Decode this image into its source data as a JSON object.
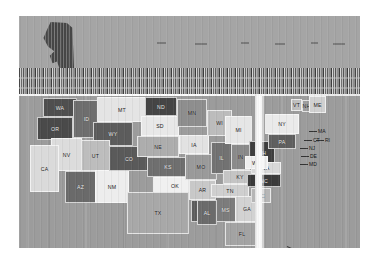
{
  "figure": {
    "kind": "choropleth-map",
    "region": "United States",
    "render_state": "corrupted",
    "background_color": "#9e9e9e",
    "frame_color": "#ffffff"
  },
  "artifacts": {
    "upper_plate_label": "corrupted-upper-plate",
    "glitch_band_label": "vertical-streak-glitch-band",
    "scanline_label": "bright-scanline",
    "white_column_label": "white-column-artifact",
    "alaska_blob_label": "alaska-dark-blob"
  },
  "markers": {
    "dc": {
      "label": "DC",
      "color": "#2f2f2f"
    },
    "hi": {
      "label": "HI"
    }
  },
  "chart_data": {
    "type": "heatmap",
    "title": "",
    "xlabel": "",
    "ylabel": "",
    "legend_position": "none",
    "grid": false,
    "categories": [
      "WA",
      "OR",
      "ID",
      "MT",
      "WY",
      "NV",
      "UT",
      "CA",
      "AZ",
      "NM",
      "CO",
      "ND",
      "SD",
      "NE",
      "KS",
      "OK",
      "TX",
      "MN",
      "IA",
      "MO",
      "AR",
      "LA",
      "WI",
      "IL",
      "MI",
      "IN",
      "OH",
      "KY",
      "TN",
      "MS",
      "AL",
      "GA",
      "FL",
      "SC",
      "NC",
      "VA",
      "WV",
      "PA",
      "NY",
      "VT",
      "NH",
      "ME",
      "MA",
      "CT",
      "RI",
      "NJ",
      "DE",
      "MD",
      "AK",
      "HI",
      "DC"
    ],
    "values": [
      0.78,
      0.8,
      0.62,
      0.18,
      0.66,
      0.22,
      0.3,
      0.2,
      0.64,
      0.24,
      0.7,
      0.82,
      0.16,
      0.44,
      0.72,
      0.14,
      0.34,
      0.36,
      0.4,
      0.46,
      0.3,
      0.74,
      0.32,
      0.68,
      0.26,
      0.6,
      0.86,
      0.28,
      0.38,
      0.76,
      0.84,
      0.42,
      0.34,
      0.3,
      0.88,
      0.36,
      0.58,
      0.72,
      0.24,
      0.4,
      0.5,
      0.26,
      0.62,
      0.54,
      0.48,
      0.66,
      0.44,
      0.52,
      0.9,
      0.3,
      0.95
    ],
    "value_range": [
      0,
      1
    ],
    "colorscale": "grayscale"
  },
  "states": [
    {
      "abbr": "WA",
      "x": 24,
      "y": 2,
      "w": 34,
      "h": 19,
      "tone": "#4f4f4f",
      "lbl": "dark"
    },
    {
      "abbr": "OR",
      "x": 18,
      "y": 21,
      "w": 36,
      "h": 23,
      "tone": "#4a4a4a",
      "lbl": "dark"
    },
    {
      "abbr": "ID",
      "x": 54,
      "y": 4,
      "w": 27,
      "h": 38,
      "tone": "#6e6e6e",
      "lbl": "dark"
    },
    {
      "abbr": "MT",
      "x": 78,
      "y": 1,
      "w": 50,
      "h": 25,
      "tone": "#e4e4e4",
      "lbl": "light"
    },
    {
      "abbr": "WY",
      "x": 74,
      "y": 26,
      "w": 40,
      "h": 24,
      "tone": "#5c5c5c",
      "lbl": "dark"
    },
    {
      "abbr": "NV",
      "x": 32,
      "y": 42,
      "w": 31,
      "h": 33,
      "tone": "#dcdcdc",
      "lbl": "light"
    },
    {
      "abbr": "UT",
      "x": 62,
      "y": 44,
      "w": 29,
      "h": 31,
      "tone": "#bdbdbd",
      "lbl": "light"
    },
    {
      "abbr": "CA",
      "x": 11,
      "y": 49,
      "w": 29,
      "h": 47,
      "tone": "#dadada",
      "lbl": "light"
    },
    {
      "abbr": "AZ",
      "x": 46,
      "y": 75,
      "w": 31,
      "h": 32,
      "tone": "#6a6a6a",
      "lbl": "dark"
    },
    {
      "abbr": "NM",
      "x": 76,
      "y": 74,
      "w": 34,
      "h": 33,
      "tone": "#ededed",
      "lbl": "light"
    },
    {
      "abbr": "CO",
      "x": 90,
      "y": 50,
      "w": 40,
      "h": 25,
      "tone": "#5a5a5a",
      "lbl": "dark"
    },
    {
      "abbr": "ND",
      "x": 126,
      "y": 1,
      "w": 32,
      "h": 19,
      "tone": "#454545",
      "lbl": "dark"
    },
    {
      "abbr": "SD",
      "x": 122,
      "y": 20,
      "w": 38,
      "h": 20,
      "tone": "#e8e8e8",
      "lbl": "light"
    },
    {
      "abbr": "NE",
      "x": 118,
      "y": 40,
      "w": 42,
      "h": 21,
      "tone": "#adadad",
      "lbl": "light"
    },
    {
      "abbr": "KS",
      "x": 128,
      "y": 61,
      "w": 42,
      "h": 20,
      "tone": "#6f6f6f",
      "lbl": "dark"
    },
    {
      "abbr": "OK",
      "x": 134,
      "y": 81,
      "w": 44,
      "h": 17,
      "tone": "#f0f0f0",
      "lbl": "light"
    },
    {
      "abbr": "TX",
      "x": 108,
      "y": 96,
      "w": 62,
      "h": 42,
      "tone": "#a8a8a8",
      "lbl": "light"
    },
    {
      "abbr": "MN",
      "x": 158,
      "y": 3,
      "w": 30,
      "h": 28,
      "tone": "#8e8e8e",
      "lbl": "light"
    },
    {
      "abbr": "IA",
      "x": 160,
      "y": 39,
      "w": 30,
      "h": 19,
      "tone": "#e2e2e2",
      "lbl": "light"
    },
    {
      "abbr": "MO",
      "x": 166,
      "y": 58,
      "w": 32,
      "h": 26,
      "tone": "#9a9a9a",
      "lbl": "light"
    },
    {
      "abbr": "AR",
      "x": 170,
      "y": 84,
      "w": 27,
      "h": 20,
      "tone": "#c8c8c8",
      "lbl": "light"
    },
    {
      "abbr": "LA",
      "x": 172,
      "y": 104,
      "w": 27,
      "h": 22,
      "tone": "#5d5d5d",
      "lbl": "dark"
    },
    {
      "abbr": "WI",
      "x": 188,
      "y": 14,
      "w": 25,
      "h": 26,
      "tone": "#bcbcbc",
      "lbl": "light"
    },
    {
      "abbr": "IL",
      "x": 192,
      "y": 46,
      "w": 21,
      "h": 32,
      "tone": "#727272",
      "lbl": "dark"
    },
    {
      "abbr": "MI",
      "x": 206,
      "y": 20,
      "w": 27,
      "h": 28,
      "tone": "#e6e6e6",
      "lbl": "light"
    },
    {
      "abbr": "IN",
      "x": 212,
      "y": 48,
      "w": 19,
      "h": 26,
      "tone": "#8a8a8a",
      "lbl": "light"
    },
    {
      "abbr": "OH",
      "x": 230,
      "y": 45,
      "w": 26,
      "h": 24,
      "tone": "#3f3f3f",
      "lbl": "dark"
    },
    {
      "abbr": "KY",
      "x": 204,
      "y": 74,
      "w": 34,
      "h": 14,
      "tone": "#c4c4c4",
      "lbl": "light"
    },
    {
      "abbr": "TN",
      "x": 192,
      "y": 88,
      "w": 38,
      "h": 13,
      "tone": "#cfcfcf",
      "lbl": "light"
    },
    {
      "abbr": "MS",
      "x": 196,
      "y": 101,
      "w": 21,
      "h": 25,
      "tone": "#7c7c7c",
      "lbl": "dark"
    },
    {
      "abbr": "AL",
      "x": 178,
      "y": 104,
      "w": 20,
      "h": 25,
      "tone": "#6b6b6b",
      "lbl": "dark"
    },
    {
      "abbr": "GA",
      "x": 216,
      "y": 100,
      "w": 24,
      "h": 26,
      "tone": "#d2d2d2",
      "lbl": "light"
    },
    {
      "abbr": "FL",
      "x": 206,
      "y": 126,
      "w": 34,
      "h": 24,
      "tone": "#a3a3a3",
      "lbl": "light"
    },
    {
      "abbr": "SC",
      "x": 232,
      "y": 92,
      "w": 20,
      "h": 15,
      "tone": "#b6b6b6",
      "lbl": "light"
    },
    {
      "abbr": "NC",
      "x": 228,
      "y": 78,
      "w": 34,
      "h": 13,
      "tone": "#3b3b3b",
      "lbl": "dark"
    },
    {
      "abbr": "VA",
      "x": 232,
      "y": 66,
      "w": 30,
      "h": 12,
      "tone": "#d8d8d8",
      "lbl": "light"
    },
    {
      "abbr": "WV",
      "x": 226,
      "y": 60,
      "w": 23,
      "h": 13,
      "tone": "#eeeeee",
      "lbl": "light"
    },
    {
      "abbr": "PA",
      "x": 249,
      "y": 38,
      "w": 28,
      "h": 15,
      "tone": "#5f5f5f",
      "lbl": "dark"
    },
    {
      "abbr": "NY",
      "x": 246,
      "y": 18,
      "w": 34,
      "h": 20,
      "tone": "#eaeaea",
      "lbl": "light"
    },
    {
      "abbr": "VT",
      "x": 272,
      "y": 3,
      "w": 11,
      "h": 12,
      "tone": "#bfbfbf",
      "lbl": "light"
    },
    {
      "abbr": "NH",
      "x": 283,
      "y": 4,
      "w": 9,
      "h": 12,
      "tone": "#9d9d9d",
      "lbl": "light"
    },
    {
      "abbr": "ME",
      "x": 290,
      "y": 0,
      "w": 17,
      "h": 17,
      "tone": "#d0d0d0",
      "lbl": "light"
    }
  ],
  "ne_labels": [
    {
      "abbr": "MA",
      "x": 299,
      "y": 32
    },
    {
      "abbr": "CT",
      "x": 294,
      "y": 41
    },
    {
      "abbr": "RI",
      "x": 306,
      "y": 41
    },
    {
      "abbr": "NJ",
      "x": 290,
      "y": 49
    },
    {
      "abbr": "DE",
      "x": 291,
      "y": 57
    },
    {
      "abbr": "MD",
      "x": 290,
      "y": 65
    }
  ]
}
